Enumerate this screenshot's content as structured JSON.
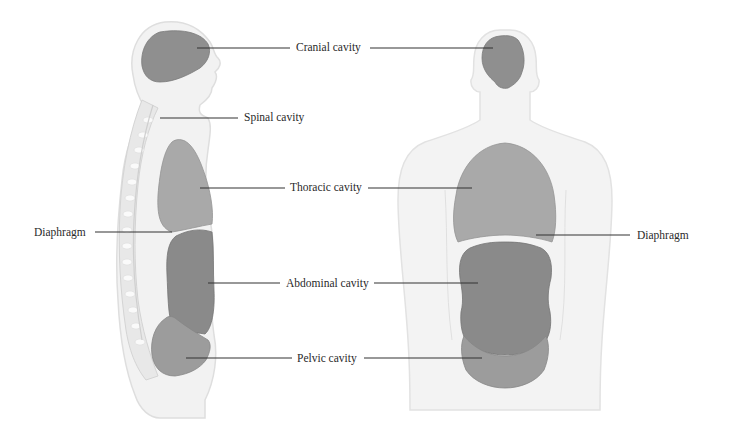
{
  "views": [
    {
      "name": "lateral-view",
      "description": "Side view of human body showing cavities"
    },
    {
      "name": "anterior-view",
      "description": "Front view of human body showing cavities"
    }
  ],
  "labels": {
    "cranial": "Cranial cavity",
    "spinal": "Spinal cavity",
    "thoracic": "Thoracic cavity",
    "diaphragm_left": "Diaphragm",
    "abdominal": "Abdominal cavity",
    "pelvic": "Pelvic cavity",
    "diaphragm_right": "Diaphragm"
  },
  "colors": {
    "body_fill": "#f1f1f1",
    "body_outline": "#dcdcdc",
    "cranial_fill": "#8f8f8f",
    "thoracic_fill": "#a9a9a9",
    "abdominal_fill": "#8a8a8a",
    "pelvic_fill": "#9c9c9c",
    "spine_fill": "#e6e6e6",
    "leader_line": "#333333"
  }
}
